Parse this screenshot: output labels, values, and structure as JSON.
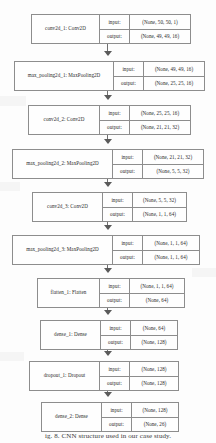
{
  "diagram": {
    "type": "keras-model-plot",
    "caption": "ig. 8.  CNN  structure  used  in  our  case  study.",
    "column_headers": {
      "input": "input:",
      "output": "output:"
    },
    "layers": [
      {
        "id": "conv2d_1",
        "label": "conv2d_1: Conv2D",
        "input": "(None, 50, 50, 1)",
        "output": "(None, 49, 49, 16)",
        "box": {
          "left": 31,
          "top": 14,
          "width": 160,
          "name_width": 68
        }
      },
      {
        "id": "max_pooling2d_1",
        "label": "max_pooling2d_1: MaxPooling2D",
        "input": "(None, 49, 49, 16)",
        "output": "(None, 25, 25, 16)",
        "box": {
          "left": 14,
          "top": 61,
          "width": 191,
          "name_width": 99
        }
      },
      {
        "id": "conv2d_2",
        "label": "conv2d_2: Conv2D",
        "input": "(None, 25, 25, 16)",
        "output": "(None, 21, 21, 32)",
        "box": {
          "left": 28,
          "top": 105,
          "width": 163,
          "name_width": 71
        }
      },
      {
        "id": "max_pooling2d_2",
        "label": "max_pooling2d_2: MaxPooling2D",
        "input": "(None, 21, 21, 32)",
        "output": "(None, 5, 5, 32)",
        "box": {
          "left": 12,
          "top": 149,
          "width": 192,
          "name_width": 100
        }
      },
      {
        "id": "conv2d_3",
        "label": "conv2d_3: Conv2D",
        "input": "(None, 5, 5, 32)",
        "output": "(None, 1, 1, 64)",
        "box": {
          "left": 32,
          "top": 192,
          "width": 155,
          "name_width": 70
        }
      },
      {
        "id": "max_pooling2d_3",
        "label": "max_pooling2d_3: MaxPooling2D",
        "input": "(None, 1, 1, 64)",
        "output": "(None, 1, 1, 64)",
        "box": {
          "left": 12,
          "top": 235,
          "width": 188,
          "name_width": 100
        }
      },
      {
        "id": "flatten_1",
        "label": "flatten_1: Flatten",
        "input": "(None, 1, 1, 64)",
        "output": "(None, 64)",
        "box": {
          "left": 37,
          "top": 278,
          "width": 148,
          "name_width": 62
        }
      },
      {
        "id": "dense_1",
        "label": "dense_1: Dense",
        "input": "(None, 64)",
        "output": "(None, 128)",
        "box": {
          "left": 40,
          "top": 320,
          "width": 138,
          "name_width": 60
        }
      },
      {
        "id": "dropout_1",
        "label": "dropout_1: Dropout",
        "input": "(None, 128)",
        "output": "(None, 128)",
        "box": {
          "left": 29,
          "top": 361,
          "width": 150,
          "name_width": 70
        }
      },
      {
        "id": "dense_2",
        "label": "dense_2: Dense",
        "input": "(None, 128)",
        "output": "(None, 26)",
        "box": {
          "left": 41,
          "top": 402,
          "width": 138,
          "name_width": 60
        }
      }
    ],
    "edges": [
      {
        "from": "conv2d_1",
        "to": "max_pooling2d_1",
        "top": 44,
        "height": 12
      },
      {
        "from": "max_pooling2d_1",
        "to": "conv2d_2",
        "top": 91,
        "height": 9
      },
      {
        "from": "conv2d_2",
        "to": "max_pooling2d_2",
        "top": 135,
        "height": 9
      },
      {
        "from": "max_pooling2d_2",
        "to": "conv2d_3",
        "top": 179,
        "height": 8
      },
      {
        "from": "conv2d_3",
        "to": "max_pooling2d_3",
        "top": 222,
        "height": 8
      },
      {
        "from": "max_pooling2d_3",
        "to": "flatten_1",
        "top": 265,
        "height": 8
      },
      {
        "from": "flatten_1",
        "to": "dense_1",
        "top": 308,
        "height": 7
      },
      {
        "from": "dense_1",
        "to": "dropout_1",
        "top": 350,
        "height": 6
      },
      {
        "from": "dropout_1",
        "to": "dense_2",
        "top": 391,
        "height": 6
      }
    ]
  }
}
